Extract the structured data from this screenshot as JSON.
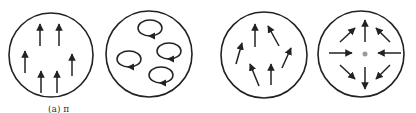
{
  "figure": {
    "stroke_color": "#222222",
    "center_dot_color": "#9a9a9a",
    "panels": [
      {
        "id": "a",
        "name": "uniform-parallel-flow",
        "circle": {
          "cx": 51,
          "cy": 55,
          "r": 42
        },
        "arrows": [
          {
            "x1": 40,
            "y1": 46,
            "x2": 40,
            "y2": 24
          },
          {
            "x1": 59,
            "y1": 46,
            "x2": 59,
            "y2": 24
          },
          {
            "x1": 25,
            "y1": 73,
            "x2": 25,
            "y2": 51
          },
          {
            "x1": 72,
            "y1": 76,
            "x2": 72,
            "y2": 54
          },
          {
            "x1": 41,
            "y1": 93,
            "x2": 41,
            "y2": 71
          },
          {
            "x1": 57,
            "y1": 93,
            "x2": 57,
            "y2": 71
          }
        ]
      },
      {
        "id": "b",
        "name": "vortices",
        "circle": {
          "cx": 149,
          "cy": 54,
          "r": 43
        },
        "loops": [
          {
            "cx": 150,
            "cy": 28,
            "rx": 12,
            "ry": 8
          },
          {
            "cx": 169,
            "cy": 51,
            "rx": 12,
            "ry": 8
          },
          {
            "cx": 129,
            "cy": 59,
            "rx": 12,
            "ry": 8
          },
          {
            "cx": 161,
            "cy": 75,
            "rx": 12,
            "ry": 8
          }
        ]
      },
      {
        "id": "c",
        "name": "random-upward-flow",
        "circle": {
          "cx": 264,
          "cy": 55,
          "r": 43
        },
        "arrows": [
          {
            "x1": 255,
            "y1": 47,
            "x2": 255,
            "y2": 24
          },
          {
            "x1": 279,
            "y1": 46,
            "x2": 268,
            "y2": 26
          },
          {
            "x1": 236,
            "y1": 64,
            "x2": 242,
            "y2": 43
          },
          {
            "x1": 282,
            "y1": 68,
            "x2": 291,
            "y2": 48
          },
          {
            "x1": 259,
            "y1": 86,
            "x2": 250,
            "y2": 64
          },
          {
            "x1": 271,
            "y1": 85,
            "x2": 271,
            "y2": 64
          }
        ]
      },
      {
        "id": "d",
        "name": "saddle-point-flow",
        "circle": {
          "cx": 361,
          "cy": 54,
          "r": 43
        },
        "center_dot": {
          "cx": 365,
          "cy": 54,
          "r": 2.5
        },
        "arrows": [
          {
            "x1": 365,
            "y1": 42,
            "x2": 365,
            "y2": 20
          },
          {
            "x1": 365,
            "y1": 67,
            "x2": 365,
            "y2": 89
          },
          {
            "x1": 329,
            "y1": 53,
            "x2": 352,
            "y2": 53
          },
          {
            "x1": 401,
            "y1": 53,
            "x2": 378,
            "y2": 53
          },
          {
            "x1": 340,
            "y1": 42,
            "x2": 355,
            "y2": 28
          },
          {
            "x1": 390,
            "y1": 42,
            "x2": 376,
            "y2": 28
          },
          {
            "x1": 340,
            "y1": 65,
            "x2": 355,
            "y2": 79
          },
          {
            "x1": 390,
            "y1": 65,
            "x2": 376,
            "y2": 79
          }
        ]
      }
    ],
    "caption_partial": {
      "text": "(a) π",
      "x": 48,
      "y": 104
    }
  }
}
